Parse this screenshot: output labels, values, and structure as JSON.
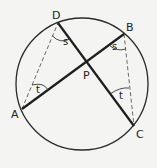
{
  "diagram": {
    "circle": {
      "cx": 82,
      "cy": 84,
      "r": 66
    },
    "points": {
      "A": {
        "label": "A",
        "x": 22,
        "y": 109,
        "lx": 11,
        "ly": 118
      },
      "B": {
        "label": "B",
        "x": 124,
        "y": 34,
        "lx": 126,
        "ly": 31
      },
      "C": {
        "label": "C",
        "x": 134,
        "y": 126,
        "lx": 136,
        "ly": 138
      },
      "D": {
        "label": "D",
        "x": 58,
        "y": 23,
        "lx": 52,
        "ly": 19
      },
      "P": {
        "label": "P",
        "x": 87,
        "y": 62,
        "lx": 83,
        "ly": 79
      }
    },
    "chords": [
      {
        "from": "A",
        "to": "B",
        "style": "solid"
      },
      {
        "from": "D",
        "to": "C",
        "style": "solid"
      }
    ],
    "dashed_segments": [
      {
        "from": "A",
        "to": "D",
        "style": "dashed"
      },
      {
        "from": "B",
        "to": "C",
        "style": "dashed"
      }
    ],
    "angles": [
      {
        "label": "s",
        "vertex": "D",
        "lx": 65,
        "ly": 44
      },
      {
        "label": "s",
        "vertex": "B",
        "lx": 114,
        "ly": 50
      },
      {
        "label": "t",
        "vertex": "A",
        "lx": 36,
        "ly": 92
      },
      {
        "label": "t",
        "vertex": "C",
        "lx": 119,
        "ly": 99
      }
    ],
    "colors": {
      "stroke": "#222222",
      "background": "#f4f4f2"
    }
  }
}
